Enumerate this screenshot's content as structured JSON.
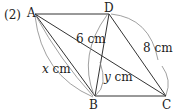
{
  "problem_number": "(2)",
  "points": {
    "A": {
      "label": "A",
      "x": 35,
      "y": 14
    },
    "D": {
      "label": "D",
      "x": 109,
      "y": 14
    },
    "B": {
      "label": "B",
      "x": 95,
      "y": 96
    },
    "C": {
      "label": "C",
      "x": 166,
      "y": 96
    }
  },
  "measures": {
    "DB": "6 cm",
    "DC": "8 cm",
    "AB_var": "x",
    "AB_unit": " cm",
    "seg_var": "y",
    "seg_unit": " cm"
  },
  "colors": {
    "line": "#333333",
    "arc": "#888888"
  }
}
